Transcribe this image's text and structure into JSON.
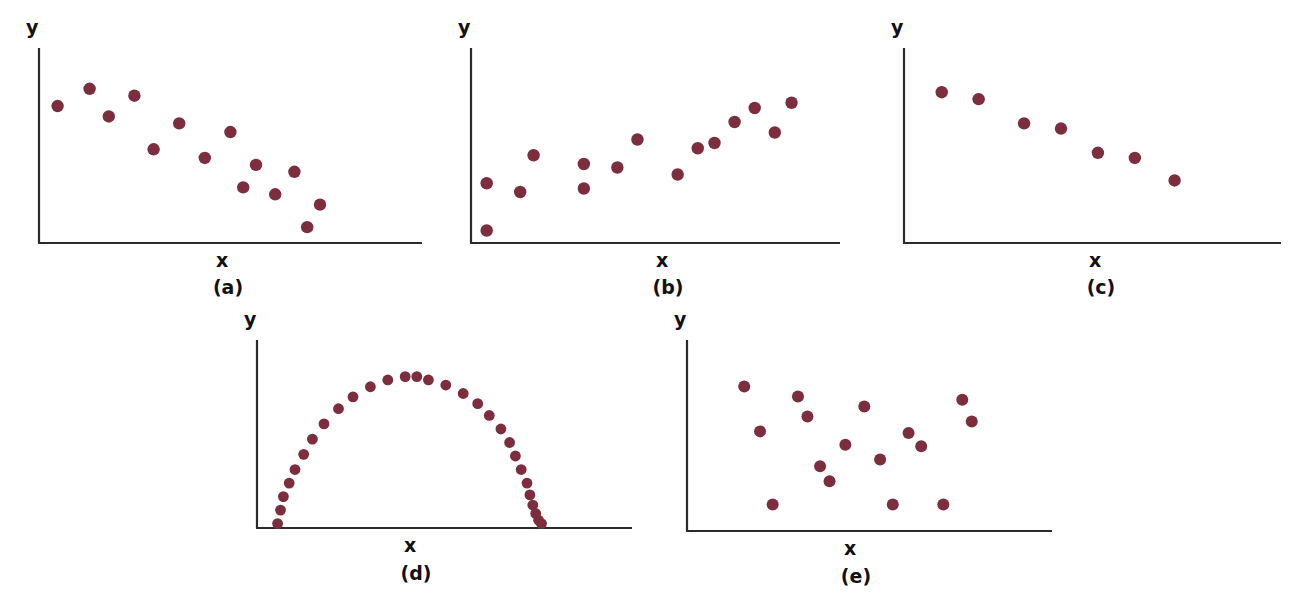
{
  "figure": {
    "background_color": "#ffffff",
    "dot_color": "#7c2d3e",
    "axis_color": "#2b2b2b",
    "label_color": "#111111",
    "panel_count": 5
  },
  "chart_data": [
    {
      "type": "scatter",
      "title": "(a)",
      "caption": "(a)",
      "xlabel": "x",
      "ylabel": "y",
      "grid": false,
      "legend": "none",
      "relationship": "strong negative linear",
      "xlim": [
        0,
        100
      ],
      "ylim": [
        0,
        100
      ],
      "n_points": 14,
      "x": [
        3,
        13,
        27,
        19,
        41,
        57,
        33,
        49,
        65,
        77,
        61,
        71,
        85,
        81
      ],
      "y": [
        78,
        88,
        84,
        72,
        68,
        63,
        53,
        48,
        44,
        40,
        31,
        27,
        21,
        8
      ]
    },
    {
      "type": "scatter",
      "title": "(b)",
      "caption": "(b)",
      "xlabel": "x",
      "ylabel": "y",
      "grid": false,
      "legend": "none",
      "relationship": "positive linear",
      "xlim": [
        0,
        100
      ],
      "ylim": [
        0,
        100
      ],
      "n_points": 15,
      "x": [
        2,
        2,
        12,
        16,
        31,
        31,
        41,
        47,
        59,
        65,
        70,
        76,
        82,
        88,
        93
      ],
      "y": [
        6,
        33,
        28,
        49,
        30,
        44,
        42,
        58,
        38,
        53,
        56,
        68,
        76,
        62,
        79
      ]
    },
    {
      "type": "scatter",
      "title": "(c)",
      "caption": "(c)",
      "xlabel": "x",
      "ylabel": "y",
      "grid": false,
      "legend": "none",
      "relationship": "strong negative linear (few points)",
      "xlim": [
        0,
        100
      ],
      "ylim": [
        0,
        100
      ],
      "n_points": 7,
      "x": [
        8,
        21,
        37,
        50,
        63,
        76,
        90
      ],
      "y": [
        86,
        82,
        68,
        65,
        51,
        48,
        35
      ]
    },
    {
      "type": "scatter",
      "title": "(d)",
      "caption": "(d)",
      "xlabel": "x",
      "ylabel": "y",
      "grid": false,
      "legend": "none",
      "relationship": "curvilinear (inverted-U / dome)",
      "xlim": [
        0,
        100
      ],
      "ylim": [
        0,
        100
      ],
      "n_points": 29,
      "x": [
        4,
        5,
        6,
        8,
        10,
        13,
        16,
        20,
        25,
        30,
        36,
        42,
        48,
        52,
        56,
        62,
        68,
        73,
        77,
        81,
        84,
        86,
        88,
        90,
        91,
        92,
        93,
        94,
        95
      ],
      "y": [
        2,
        10,
        18,
        26,
        34,
        43,
        52,
        61,
        70,
        77,
        83,
        87,
        89,
        89,
        87,
        84,
        79,
        73,
        66,
        58,
        50,
        42,
        34,
        26,
        19,
        13,
        8,
        4,
        2
      ]
    },
    {
      "type": "scatter",
      "title": "(e)",
      "caption": "(e)",
      "xlabel": "x",
      "ylabel": "y",
      "grid": false,
      "legend": "none",
      "relationship": "no correlation (random scatter)",
      "xlim": [
        0,
        100
      ],
      "ylim": [
        0,
        100
      ],
      "n_points": 16,
      "x": [
        14,
        19,
        23,
        31,
        34,
        38,
        41,
        46,
        52,
        57,
        61,
        66,
        70,
        77,
        83,
        86
      ],
      "y": [
        84,
        57,
        13,
        78,
        66,
        36,
        27,
        49,
        72,
        40,
        13,
        56,
        48,
        13,
        76,
        63
      ]
    }
  ],
  "panels": [
    {
      "id": "a",
      "ylabel": "y",
      "xlabel": "x",
      "caption": "(a)"
    },
    {
      "id": "b",
      "ylabel": "y",
      "xlabel": "x",
      "caption": "(b)"
    },
    {
      "id": "c",
      "ylabel": "y",
      "xlabel": "x",
      "caption": "(c)"
    },
    {
      "id": "d",
      "ylabel": "y",
      "xlabel": "x",
      "caption": "(d)"
    },
    {
      "id": "e",
      "ylabel": "y",
      "xlabel": "x",
      "caption": "(e)"
    }
  ]
}
